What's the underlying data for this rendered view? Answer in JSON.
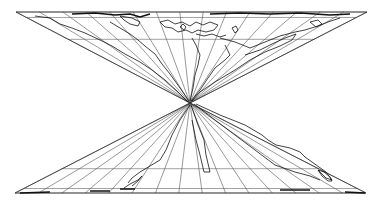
{
  "map": {
    "title": "",
    "projection_description": "World map in a degenerate projection: single pole point at center, meridians fanning to top and bottom edges",
    "graticule": {
      "meridian_count_per_half": 15,
      "parallels_top_fractions": [
        0.0,
        0.06,
        0.3
      ],
      "parallels_bottom_fractions": [
        0.0,
        0.05,
        0.27
      ]
    },
    "colors": {
      "background": "#ffffff",
      "lines": "#444444",
      "coastline": "#111111"
    },
    "labels": []
  }
}
